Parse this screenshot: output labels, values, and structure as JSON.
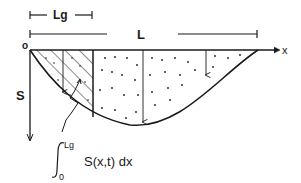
{
  "diagram": {
    "labels": {
      "origin": "o",
      "x_axis": "x",
      "y_axis": "S",
      "lg_dimension": "Lg",
      "l_dimension": "L"
    },
    "integral": {
      "lower_limit": "0",
      "upper_limit": "Lg",
      "integrand": "S(x,t) dx"
    },
    "colors": {
      "ink": "#1a1a1a",
      "background": "#ffffff"
    }
  }
}
